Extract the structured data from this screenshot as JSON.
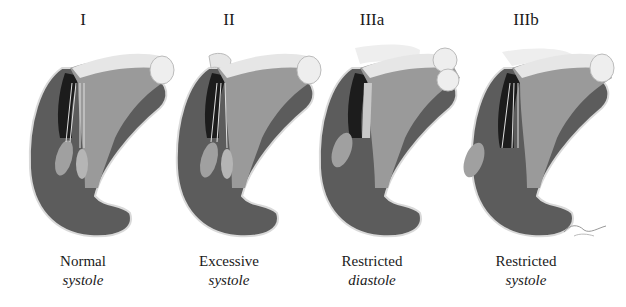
{
  "figure": {
    "colors": {
      "myocardium": "#5c5c5c",
      "myocardium_edge": "#d9d9d9",
      "cavity_dark": "#1c1c1c",
      "atrium_light": "#e6e6e6",
      "valve_mid": "#8a8a8a",
      "background": "#ffffff",
      "text": "#1a1a1a"
    },
    "panels": [
      {
        "id": "I",
        "heading": "I",
        "caption_line1": "Normal",
        "caption_line2": "systole"
      },
      {
        "id": "II",
        "heading": "II",
        "caption_line1": "Excessive",
        "caption_line2": "systole"
      },
      {
        "id": "IIIa",
        "heading": "IIIa",
        "caption_line1": "Restricted",
        "caption_line2": "diastole"
      },
      {
        "id": "IIIb",
        "heading": "IIIb",
        "caption_line1": "Restricted",
        "caption_line2": "systole"
      }
    ]
  }
}
